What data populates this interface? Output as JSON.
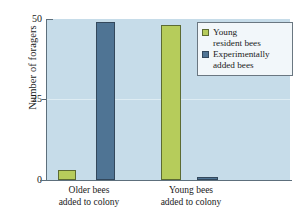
{
  "chart_data": {
    "type": "bar",
    "title": "",
    "subtitle": "",
    "xlabel": "",
    "ylabel": "Number of foragers",
    "categories": [
      "Older bees\nadded to colony",
      "Young bees\nadded to colony"
    ],
    "category_lines": [
      [
        "Older bees",
        "added to colony"
      ],
      [
        "Young bees",
        "added to colony"
      ]
    ],
    "series": [
      {
        "name": "Young resident bees",
        "values": [
          3,
          48
        ],
        "color": "#b6cc5b"
      },
      {
        "name": "Experimentally added bees",
        "values": [
          49,
          1
        ],
        "color": "#4f7494"
      }
    ],
    "legend_lines": [
      [
        "Young",
        "resident bees"
      ],
      [
        "Experimentally",
        "added bees"
      ]
    ],
    "ylim": [
      0,
      50
    ],
    "yticks": [
      0,
      25,
      50
    ],
    "ytick_labels": [
      "0",
      "25",
      "50"
    ],
    "grid": true,
    "grid_axis": "y",
    "legend_position": "top-right",
    "plot_background": "#c6dce9",
    "axis_color": "#5d6f7c"
  }
}
